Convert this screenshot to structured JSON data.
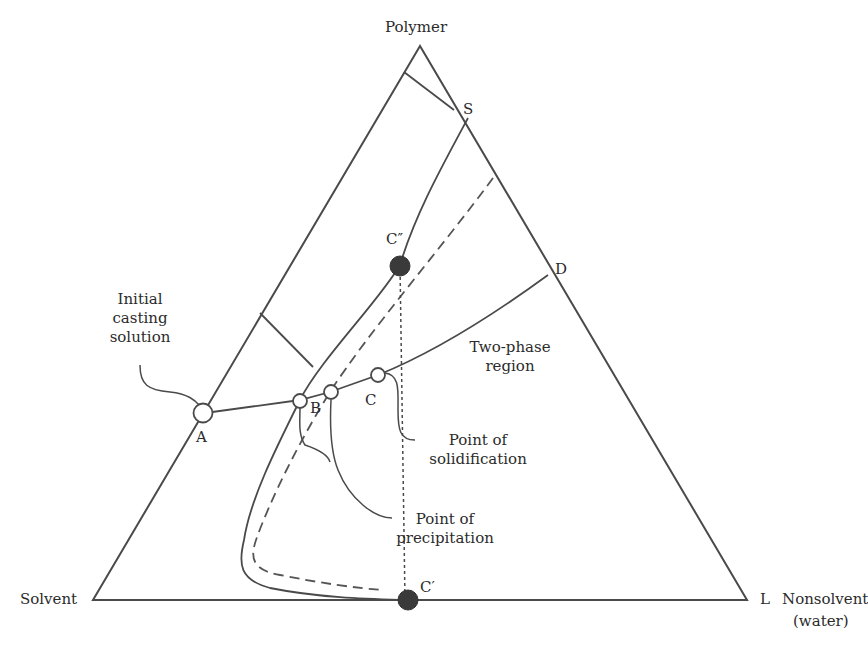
{
  "diagram": {
    "type": "ternary-phase-diagram",
    "vertices": {
      "top": "Polymer",
      "bottom_left": "Solvent",
      "bottom_right_line1": "Nonsolvent",
      "bottom_right_line2": "(water)"
    },
    "points": {
      "A": "A",
      "B": "B",
      "C": "C",
      "D": "D",
      "S": "S",
      "L": "L",
      "C_prime": "C′",
      "C_double_prime": "C″"
    },
    "annotations": {
      "initial_casting_solution": [
        "Initial",
        "casting",
        "solution"
      ],
      "two_phase_region": [
        "Two-phase",
        "region"
      ],
      "point_of_solidification": [
        "Point of",
        "solidification"
      ],
      "point_of_precipitation": [
        "Point of",
        "precipitation"
      ]
    },
    "styles": {
      "line_color": "#4a4a4a",
      "marker_fill": "#3a3a3a",
      "text_color": "#2b2b2b"
    }
  }
}
